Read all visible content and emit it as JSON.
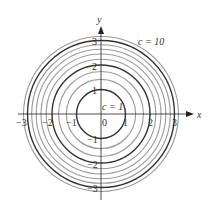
{
  "chart_data": {
    "type": "contour",
    "levels": [
      1,
      2,
      3,
      4,
      5,
      6,
      7,
      8,
      9,
      10
    ],
    "emphasized_levels": [
      1,
      4,
      9
    ],
    "x_axis": {
      "label": "x",
      "ticks": [
        "-3",
        "-2",
        "-1",
        "0",
        "1",
        "2",
        "3"
      ],
      "range": [
        -3.2,
        3.2
      ]
    },
    "y_axis": {
      "label": "y",
      "ticks": [
        "3",
        "2",
        "1",
        "-1",
        "-2",
        "-3"
      ],
      "range": [
        -3.2,
        3.5
      ]
    },
    "annotations": [
      {
        "text": "c = 10",
        "x": 1.7,
        "y": 3.0
      },
      {
        "text": "c = 1",
        "x": 0.1,
        "y": 0.35
      }
    ]
  },
  "labels": {
    "x_axis": "x",
    "y_axis": "y",
    "origin": "0",
    "c_outer": "c = 10",
    "c_inner": "c = 1",
    "xt_m3": "−3",
    "xt_m2": "−2",
    "xt_m1": "−1",
    "xt_1": "1",
    "xt_2": "2",
    "xt_3": "3",
    "yt_3": "3",
    "yt_2": "2",
    "yt_1": "1",
    "yt_m1": "−1",
    "yt_m2": "−2",
    "yt_m3": "−3"
  },
  "colors": {
    "light": "#9a9a9a",
    "dark": "#333333",
    "axis": "#222222"
  }
}
